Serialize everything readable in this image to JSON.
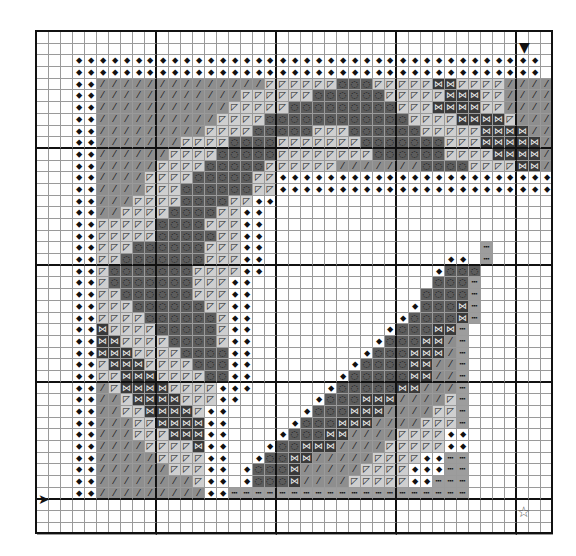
{
  "chart_data": {
    "type": "table",
    "title": "",
    "grid": {
      "columns": 43,
      "rows": 43,
      "cell_px": 12,
      "bold_every": 10
    },
    "legend": {
      ".": {
        "name": "empty",
        "color": "#ffffff",
        "glyph": ""
      },
      "k": {
        "name": "diamond-slash stitch",
        "color": "#ffffff",
        "glyph": "⬥"
      },
      "m": {
        "name": "slash stitch",
        "color": "#8e8e8e",
        "glyph": "⁄"
      },
      "l": {
        "name": "triangle stitch",
        "color": "#cfcfcf",
        "glyph": "◸"
      },
      "d": {
        "name": "circle stitch",
        "color": "#5c5c5c",
        "glyph": "◌"
      },
      "x": {
        "name": "cross stitch",
        "color": "#3a3a3a",
        "glyph": "⋈"
      },
      "b": {
        "name": "backstitch dotted",
        "color": "#9d9d9d",
        "glyph": "┅"
      }
    },
    "rows_data": [
      "...........................................",
      "...........................................",
      "...kkkkkkkkkkkkkkkkkkkkkkkkkkkkkkkkkkkkkkk.",
      "...kkkkkkkkkkkkkkkkkkkkkkkkkkkkkkkkkkkkkkk.",
      "...kkmmmmmmmmmmmmmmlllllldddlllllxxllllmmmm.",
      "...kkmmmmmmmmmmmmllllllddddddlllllxxxllmmmm.",
      "...kkmmmmmmmmmmmllllldddddddddlllxxxxllmmmm.",
      "...kkmmmmmmmmmmllllddddddddddddllllxxxxlmmm.",
      "...kkmmmmmmmmmlllldddddlllddddddlllllxxxxmm.",
      "...kkmmmmmmmllllddddllllllldddddddlllxxxxxm.",
      "...kkmmmmmmlllldddddllllllllddddddllllxxxxm.",
      "...kkmmmmmlllldddddllllllmmmmmmmddddllllxxm.",
      "...kkmmmmlllldddddllkkkkkkkkkkkkkkkkkkkkkkk.",
      "...kkmmmmlllddddddllkkkkkkkkkkkkkkkkkkkkkkk.",
      "...kkmmmllllddddllkk.......................",
      "...kkmmllllddddllkk........................",
      "...kklllllddddlllkk........................",
      "...kkllllldddddllkk........................",
      "...kklllddddddlllkk..................b.....",
      "...kklldddddddlllkk...............kk.b.....",
      "...kkldddddddllllkk..............kddd......",
      "...kkldddddddlllkk...............dddb......",
      "...kkllddddddlllkk..............ddddb......",
      "...kklllddddddllkk.............kdddxb......",
      "...kkllllddddddlkk............kddddxb......",
      "...kkxlllldddddlkk...........kdddxxb.......",
      "...kkxxllllddddlkk..........kdddxxmb.......",
      "...kkxxxllllddddkk.........kdddxxxmb.......",
      "...kklxxxlllldddkk........kddddxxmmb.......",
      "...kkllxxxllllddkk.......kdddddxxmmb.......",
      "...kkmlxxxxllllkkk......kdddddxxmmmb.......",
      "...kkmmlxxxxlllkk......kdddxxxmmmmlb.......",
      "...kkmmllxxxxlkk......kdddxxxmmmmllb.......",
      "...kkmmmllxxxxkk.....kdddxxxmmmmlllb.......",
      "...kkmmmlllxxxkk....kdddxxmmmmllllkk.......",
      "...kkmmmmllllxkk...kddxxxmmmmlllllkk.......",
      "...kkmmmmmllllkk..kddxxmmmmmllllkkbb.......",
      "...kkmmmmmmlllkk.kdddxmmmmmllllkkkbb.......",
      "...kkmmmmmmmmlkk.kdddxmmmmlllllkkbbb.......",
      "...kkmmmmmmmmmkkbbbbbbbbbbbbbbbbbbbb.......",
      "...........................................",
      "...........................................",
      "..........................................."
    ]
  },
  "markers": {
    "top_arrow": "▼",
    "left_arrow": "➤",
    "center_star": "☆"
  },
  "colors": {
    "grid_line": "#9a9a9a",
    "bold_line": "#111111"
  }
}
